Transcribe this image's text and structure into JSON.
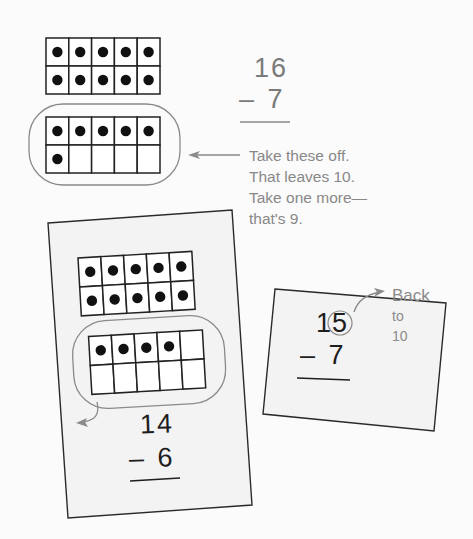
{
  "colors": {
    "background": "#fbfbfb",
    "card_fill": "#f3f3f3",
    "card_border": "#2a2a2a",
    "annotation_gray": "#8a8a8a",
    "counter": "#111111"
  },
  "example_top": {
    "ten_frame_full": {
      "filled": 10,
      "cells": 10
    },
    "ten_frame_partial": {
      "filled": 6,
      "cells": 10,
      "circled": true
    },
    "problem": {
      "minuend": "16",
      "operator": "–",
      "subtrahend": "7"
    },
    "note_lines": [
      "Take these off.",
      "That leaves 10.",
      "Take one more—",
      "that's 9."
    ]
  },
  "card_left": {
    "ten_frame_full": {
      "filled": 10,
      "cells": 10
    },
    "ten_frame_partial": {
      "filled": 4,
      "cells": 10,
      "circled": true
    },
    "problem": {
      "minuend": "14",
      "operator": "–",
      "subtrahend": "6"
    }
  },
  "card_right": {
    "problem": {
      "minuend_tens": "1",
      "minuend_ones_circled": "5",
      "operator": "–",
      "subtrahend": "7"
    },
    "note_lines": [
      "Back",
      "to",
      "10"
    ]
  }
}
